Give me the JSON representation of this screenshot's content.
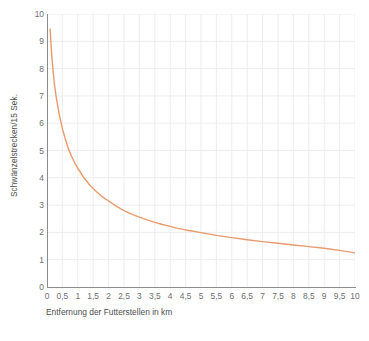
{
  "chart_data": {
    "type": "line",
    "title": "",
    "subtitle": "",
    "xlabel": "Entfernung der Futterstellen in km",
    "ylabel": "Schwänzelstrecken/15 Sek.",
    "xlim": [
      0,
      10
    ],
    "ylim": [
      0,
      10
    ],
    "grid": true,
    "legend": "none",
    "x_ticks": [
      "0",
      "0,5",
      "1",
      "1,5",
      "2",
      "2,5",
      "3",
      "3,5",
      "4",
      "4,5",
      "5",
      "5,5",
      "6",
      "6,5",
      "7",
      "7,5",
      "8",
      "8,5",
      "9",
      "9,5",
      "10"
    ],
    "x_tick_values": [
      0,
      0.5,
      1,
      1.5,
      2,
      2.5,
      3,
      3.5,
      4,
      4.5,
      5,
      5.5,
      6,
      6.5,
      7,
      7.5,
      8,
      8.5,
      9,
      9.5,
      10
    ],
    "y_ticks": [
      "0",
      "1",
      "2",
      "3",
      "4",
      "5",
      "6",
      "7",
      "8",
      "9",
      "10"
    ],
    "y_tick_values": [
      0,
      1,
      2,
      3,
      4,
      5,
      6,
      7,
      8,
      9,
      10
    ],
    "series": [
      {
        "name": "Schwänzelstrecken pro 15 Sekunden",
        "color": "#E89A6E",
        "line_width": 1.4,
        "x": [
          0.1,
          0.15,
          0.2,
          0.25,
          0.3,
          0.4,
          0.5,
          0.6,
          0.7,
          0.8,
          0.9,
          1.0,
          1.2,
          1.4,
          1.6,
          1.8,
          2.0,
          2.25,
          2.5,
          2.75,
          3.0,
          3.25,
          3.5,
          3.75,
          4.0,
          4.25,
          4.5,
          4.75,
          5.0,
          5.5,
          6.0,
          6.5,
          7.0,
          7.5,
          8.0,
          8.5,
          9.0,
          9.5,
          10.0
        ],
        "y": [
          9.45,
          8.55,
          7.9,
          7.35,
          6.95,
          6.3,
          5.8,
          5.4,
          5.05,
          4.78,
          4.55,
          4.35,
          4.0,
          3.72,
          3.5,
          3.3,
          3.15,
          2.96,
          2.8,
          2.67,
          2.56,
          2.46,
          2.37,
          2.29,
          2.22,
          2.15,
          2.09,
          2.04,
          1.99,
          1.89,
          1.81,
          1.73,
          1.66,
          1.6,
          1.54,
          1.48,
          1.42,
          1.34,
          1.25
        ]
      }
    ],
    "colors": {
      "curve": "#E89A6E",
      "grid": "#EDEDED",
      "axis": "#8C8C8E",
      "tick_text": "#6D6E71",
      "axis_title_text": "#4D4D4F",
      "background": "#FFFFFF"
    }
  }
}
